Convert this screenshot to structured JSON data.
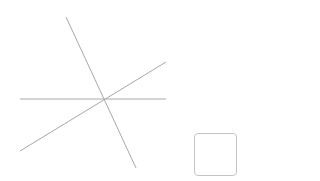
{
  "diagram": {
    "line_color": "#a8a8a8",
    "intersection": {
      "x": 104,
      "y": 99
    },
    "lines": [
      {
        "name": "steep-line",
        "x1": 66,
        "y1": 17,
        "x2": 136,
        "y2": 168
      },
      {
        "name": "horizontal-line",
        "x1": 20,
        "y1": 99,
        "x2": 166,
        "y2": 99
      },
      {
        "name": "diagonal-line",
        "x1": 20,
        "y1": 151,
        "x2": 166,
        "y2": 62
      }
    ]
  },
  "square_button": {
    "label": "",
    "border_color": "#c4c4c4"
  }
}
